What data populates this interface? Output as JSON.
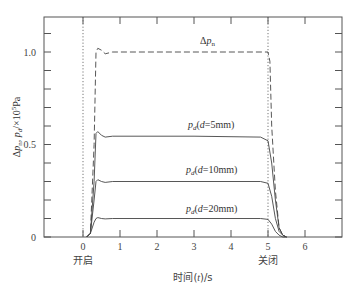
{
  "chart_data": {
    "type": "line",
    "title": "",
    "xlabel": "时间(t)/s",
    "ylabel": "Δp_n, p_d/×10^5Pa",
    "xlim": [
      -2.2,
      6.95
    ],
    "ylim": [
      0,
      1.2
    ],
    "x_ticks": [
      0,
      1,
      2,
      3,
      4,
      5,
      6
    ],
    "x_tick_labels": [
      "0",
      "1",
      "2",
      "3",
      "4",
      "5",
      "6"
    ],
    "y_ticks": [
      0,
      0.5,
      1.0
    ],
    "y_tick_labels": [
      "0",
      "0.5",
      "1.0"
    ],
    "y_minor_ticks": [
      0.1,
      0.2,
      0.3,
      0.4,
      0.6,
      0.7,
      0.8,
      0.9,
      1.1
    ],
    "grid": false,
    "vlines": [
      {
        "x": 0,
        "label": "开启",
        "style": "dotted"
      },
      {
        "x": 5,
        "label": "关闭",
        "style": "dotted"
      }
    ],
    "series": [
      {
        "name": "Δp_n",
        "style": "dashed",
        "x": [
          0.1,
          0.2,
          0.3,
          0.35,
          0.4,
          0.5,
          0.6,
          0.8,
          1.0,
          3.0,
          5.0,
          5.05,
          5.1,
          5.2,
          5.3,
          5.4,
          5.5
        ],
        "values": [
          0.0,
          0.02,
          0.5,
          1.0,
          1.02,
          1.01,
          0.99,
          1.0,
          1.0,
          1.0,
          1.0,
          0.95,
          0.6,
          0.25,
          0.05,
          0.01,
          0.0
        ]
      },
      {
        "name": "p_d(d=5mm)",
        "style": "solid",
        "x": [
          0.1,
          0.2,
          0.3,
          0.35,
          0.4,
          0.5,
          0.6,
          0.8,
          1.0,
          3.0,
          4.8,
          5.0,
          5.1,
          5.2,
          5.3,
          5.4,
          5.5
        ],
        "values": [
          0.0,
          0.02,
          0.3,
          0.56,
          0.57,
          0.55,
          0.54,
          0.545,
          0.545,
          0.545,
          0.54,
          0.52,
          0.4,
          0.2,
          0.05,
          0.01,
          0.0
        ]
      },
      {
        "name": "p_d(d=10mm)",
        "style": "solid",
        "x": [
          0.1,
          0.2,
          0.3,
          0.35,
          0.4,
          0.5,
          0.6,
          0.8,
          1.0,
          3.0,
          4.8,
          5.0,
          5.1,
          5.2,
          5.3,
          5.4,
          5.5
        ],
        "values": [
          0.0,
          0.02,
          0.2,
          0.3,
          0.31,
          0.3,
          0.295,
          0.3,
          0.3,
          0.3,
          0.3,
          0.29,
          0.22,
          0.1,
          0.03,
          0.01,
          0.0
        ]
      },
      {
        "name": "p_d(d=20mm)",
        "style": "solid",
        "x": [
          0.1,
          0.2,
          0.3,
          0.35,
          0.4,
          0.5,
          0.6,
          0.8,
          1.0,
          3.0,
          4.8,
          5.0,
          5.1,
          5.2,
          5.3,
          5.4,
          5.5
        ],
        "values": [
          0.0,
          0.02,
          0.08,
          0.1,
          0.105,
          0.1,
          0.098,
          0.1,
          0.1,
          0.1,
          0.1,
          0.095,
          0.07,
          0.03,
          0.01,
          0.0,
          0.0
        ]
      }
    ],
    "annotations": [
      {
        "text": "Δp_n",
        "x": 3.0,
        "y": 1.07
      },
      {
        "text": "p_d(d=5mm)",
        "x": 2.85,
        "y": 0.6
      },
      {
        "text": "p_d(d=10mm)",
        "x": 2.85,
        "y": 0.36
      },
      {
        "text": "p_d(d=20mm)",
        "x": 2.85,
        "y": 0.15
      }
    ]
  },
  "labels": {
    "xlabel_pre": "时间(",
    "xlabel_var": "t",
    "xlabel_post": ")/s",
    "open": "开启",
    "close": "关闭",
    "ylabel_delta": "Δ",
    "ylabel_p": "p",
    "ylabel_n_sub": "n",
    "ylabel_mid": ", ",
    "ylabel_pd": "p",
    "ylabel_d_sub": "d",
    "ylabel_post": "/×10",
    "ylabel_exp": "5",
    "ylabel_unit": "Pa",
    "ann_dpn_delta": "Δ",
    "ann_dpn_p": "p",
    "ann_dpn_sub": "n",
    "ann_5_p": "p",
    "ann_5_sub": "d",
    "ann_5_pre": "(",
    "ann_5_d": "d",
    "ann_5_rest": "=5mm)",
    "ann_10_rest": "=10mm)",
    "ann_20_rest": "=20mm)"
  }
}
